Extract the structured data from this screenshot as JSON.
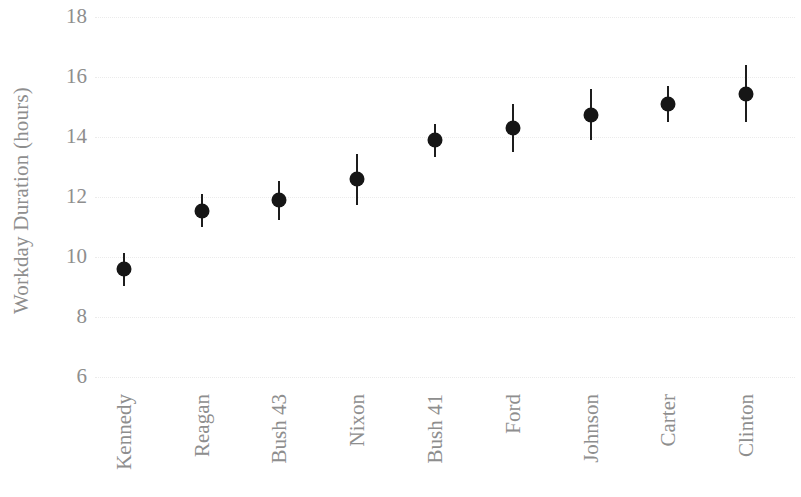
{
  "chart_data": {
    "type": "scatter",
    "title": "",
    "xlabel": "",
    "ylabel": "Workday Duration (hours)",
    "ylim": [
      6,
      18
    ],
    "yticks": [
      18,
      16,
      14,
      12,
      10,
      8,
      6
    ],
    "ytick_labels": [
      "18",
      "16",
      "14",
      "12",
      "10",
      "8",
      "6"
    ],
    "grid": true,
    "legend": "none",
    "marker": "filled-circle-with-errorbars",
    "categories": [
      "Kennedy",
      "Reagan",
      "Bush 43",
      "Nixon",
      "Bush 41",
      "Ford",
      "Johnson",
      "Carter",
      "Clinton"
    ],
    "values": [
      9.6,
      11.55,
      11.9,
      12.6,
      13.9,
      14.3,
      14.75,
      15.1,
      15.45
    ],
    "errors": [
      0.55,
      0.55,
      0.65,
      0.85,
      0.55,
      0.8,
      0.85,
      0.6,
      0.95
    ],
    "series": [
      {
        "name": "Workday Duration",
        "points": [
          {
            "category": "Kennedy",
            "value": 9.6,
            "err_low": 9.05,
            "err_high": 10.15
          },
          {
            "category": "Reagan",
            "value": 11.55,
            "err_low": 11.0,
            "err_high": 12.1
          },
          {
            "category": "Bush 43",
            "value": 11.9,
            "err_low": 11.25,
            "err_high": 12.55
          },
          {
            "category": "Nixon",
            "value": 12.6,
            "err_low": 11.75,
            "err_high": 13.45
          },
          {
            "category": "Bush 41",
            "value": 13.9,
            "err_low": 13.35,
            "err_high": 14.45
          },
          {
            "category": "Ford",
            "value": 14.3,
            "err_low": 13.5,
            "err_high": 15.1
          },
          {
            "category": "Johnson",
            "value": 14.75,
            "err_low": 13.9,
            "err_high": 15.6
          },
          {
            "category": "Carter",
            "value": 15.1,
            "err_low": 14.5,
            "err_high": 15.7
          },
          {
            "category": "Clinton",
            "value": 15.45,
            "err_low": 14.5,
            "err_high": 16.4
          }
        ]
      }
    ],
    "colors": {
      "marker": "#161616",
      "errorbar": "#1d1d1d",
      "gridline": "#e8e8e8",
      "text": "#8e8e8e",
      "background": "#ffffff"
    }
  }
}
